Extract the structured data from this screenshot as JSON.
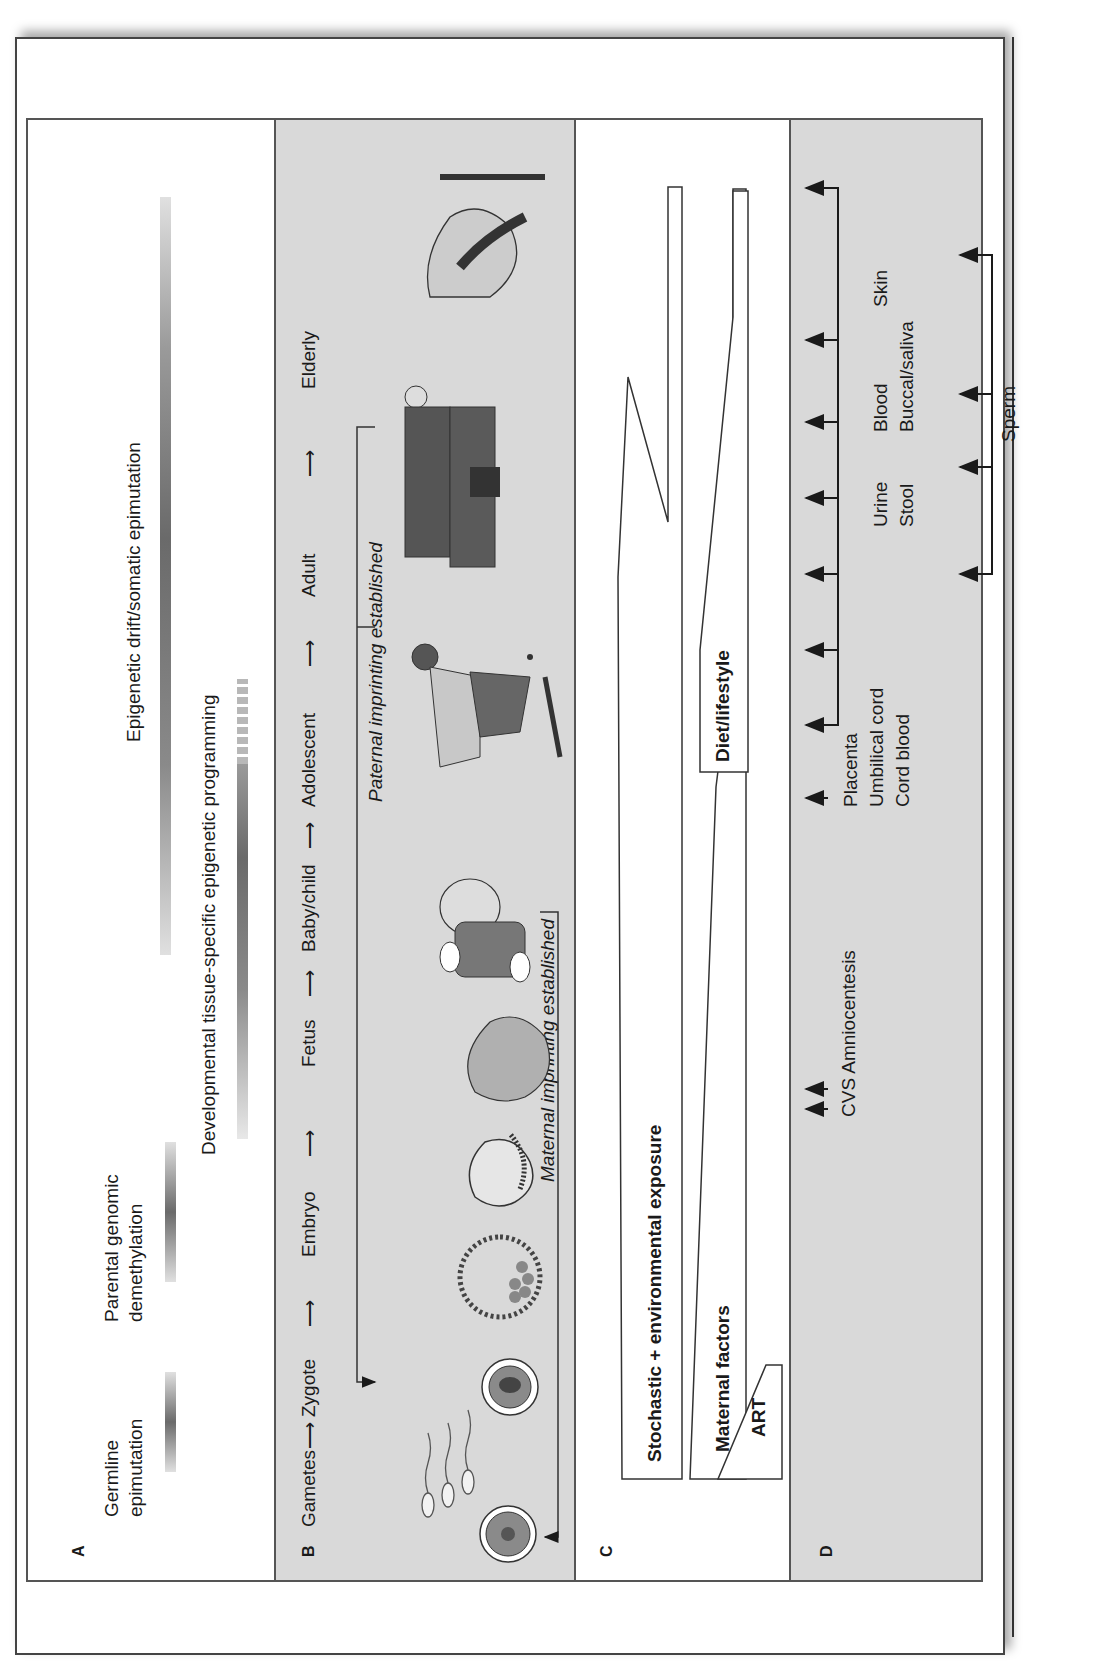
{
  "figure": {
    "orientation": "rotated-90-ccw",
    "panels": {
      "A": {
        "letter": "A",
        "bars": [
          {
            "label_line1": "Germline",
            "label_line2": "epimutation"
          },
          {
            "label_line1": "Parental genomic",
            "label_line2": "demethylation"
          },
          {
            "label": "Developmental tissue-specific epigenetic programming"
          },
          {
            "label": "Epigenetic drift/somatic epimutation"
          }
        ]
      },
      "B": {
        "letter": "B",
        "stages": [
          "Gametes",
          "Zygote",
          "Embryo",
          "Fetus",
          "Baby/child",
          "Adolescent",
          "Adult",
          "Elderly"
        ],
        "arrow_glyph": "→",
        "imprinting": {
          "paternal": "Paternal imprinting established",
          "maternal": "Maternal imprinting established"
        },
        "illustrations": [
          "oocyte-icon",
          "sperm-icon",
          "zygote-icon",
          "blastocyst-icon",
          "embryo-icon",
          "fetus-icon",
          "baby-icon",
          "adolescent-skateboarder-icon",
          "adult-businessman-icon",
          "elderly-person-icon"
        ]
      },
      "C": {
        "letter": "C",
        "factors": [
          {
            "label": "Stochastic + environmental exposure"
          },
          {
            "label": "Maternal factors"
          },
          {
            "label": "Diet/lifestyle"
          },
          {
            "label": "ART"
          }
        ]
      },
      "D": {
        "letter": "D",
        "sample_labels": {
          "prenatal": "CVS Amniocentesis",
          "birth": [
            "Placenta",
            "Umbilical cord",
            "Cord blood"
          ],
          "row1": [
            "Urine",
            "Blood",
            "Skin"
          ],
          "row2": [
            "Stool",
            "Buccal/saliva"
          ],
          "male": "Sperm"
        }
      }
    },
    "colors": {
      "panel_gray": "#d9d9d9",
      "panel_white": "#ffffff",
      "line": "#1a1a1a",
      "bar_dark": "#707070",
      "bar_light": "#d8d8d8"
    }
  }
}
